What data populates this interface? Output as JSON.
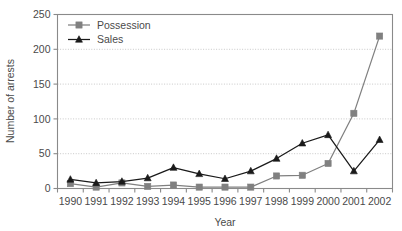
{
  "chart_data": {
    "type": "line",
    "title": "",
    "xlabel": "Year",
    "ylabel": "Number of arrests",
    "categories": [
      "1990",
      "1991",
      "1992",
      "1993",
      "1994",
      "1995",
      "1996",
      "1997",
      "1998",
      "1999",
      "2000",
      "2001",
      "2002"
    ],
    "series": [
      {
        "name": "Possession",
        "marker": "square",
        "color": "#808080",
        "values": [
          7,
          2,
          8,
          3,
          5,
          2,
          2,
          2,
          18,
          19,
          36,
          108,
          219
        ]
      },
      {
        "name": "Sales",
        "marker": "triangle",
        "color": "#1a1a1a",
        "values": [
          13,
          8,
          10,
          15,
          30,
          21,
          14,
          25,
          43,
          65,
          77,
          25,
          70
        ]
      }
    ],
    "ylim": [
      0,
      250
    ],
    "yticks": [
      "0",
      "50",
      "100",
      "150",
      "200",
      "250"
    ],
    "ytick_values": [
      0,
      50,
      100,
      150,
      200,
      250
    ],
    "grid": "horizontal",
    "legend_position": "top-left"
  },
  "legend": {
    "items": [
      {
        "label": "Possession"
      },
      {
        "label": "Sales"
      }
    ]
  },
  "axes": {
    "y_title": "Number of arrests",
    "x_title": "Year"
  },
  "colors": {
    "possession": "#808080",
    "sales": "#1a1a1a",
    "grid": "#c8c8c8",
    "frame": "#8a8a8a",
    "background": "#ffffff"
  }
}
